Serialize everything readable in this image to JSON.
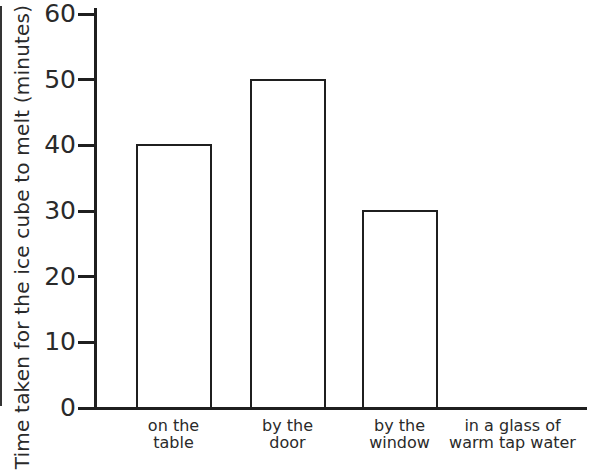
{
  "chart_data": {
    "type": "bar",
    "title": "",
    "categories": [
      [
        "on the",
        "table"
      ],
      [
        "by the",
        "door"
      ],
      [
        "by the",
        "window"
      ],
      [
        "in a glass of",
        "warm tap water"
      ]
    ],
    "values": [
      40,
      50,
      30,
      0
    ],
    "ylabel": "Time taken for the ice cube to melt (minutes)",
    "xlabel": "",
    "ylim": [
      0,
      60
    ],
    "yticks": [
      60,
      50,
      40,
      30,
      20,
      10,
      0
    ],
    "grid": false,
    "legend": null,
    "bar_fill": "#ffffff",
    "bar_border": "#1f1f1f",
    "axis_color": "#1f1f1f",
    "text_color": "#2a2a2a",
    "background": "#ffffff"
  }
}
